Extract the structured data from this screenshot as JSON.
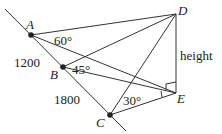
{
  "diagram": {
    "points": {
      "A": {
        "label": "A",
        "x": 31,
        "y": 35
      },
      "B": {
        "label": "B",
        "x": 63,
        "y": 67
      },
      "C": {
        "label": "C",
        "x": 110,
        "y": 115
      },
      "D": {
        "label": "D",
        "x": 176,
        "y": 14
      },
      "E": {
        "label": "E",
        "x": 176,
        "y": 93
      }
    },
    "angles": {
      "at_A": "60°",
      "at_B": "45°",
      "at_C": "30°"
    },
    "lengths": {
      "AB": "1200",
      "BC": "1800"
    },
    "vertical_label": "height",
    "colors": {
      "line": "#333333",
      "point": "#222222",
      "text": "#222222"
    }
  }
}
